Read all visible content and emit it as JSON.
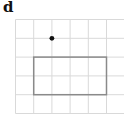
{
  "panel_label": "d",
  "grid": {
    "columns": 6,
    "rows": 5,
    "line_color": "#d9d9d9"
  },
  "rectangle": {
    "col_start": 1,
    "col_end": 5,
    "row_start": 2,
    "row_end": 4,
    "stroke_color": "#8a8a8a"
  },
  "point": {
    "col": 2,
    "row": 1,
    "color": "#111111"
  }
}
